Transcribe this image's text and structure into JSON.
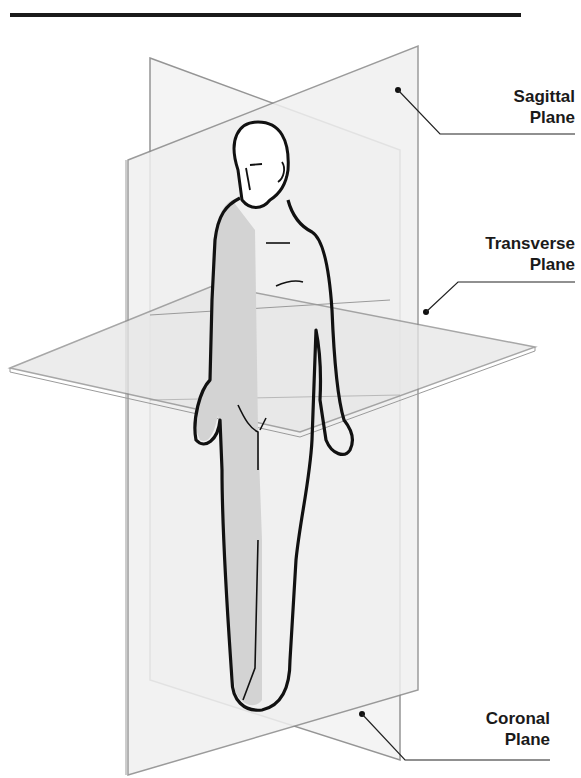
{
  "diagram": {
    "labels": [
      {
        "id": "sagittal",
        "line1": "Sagittal",
        "line2": "Plane"
      },
      {
        "id": "transverse",
        "line1": "Transverse",
        "line2": "Plane"
      },
      {
        "id": "coronal",
        "line1": "Coronal",
        "line2": "Plane"
      }
    ],
    "colors": {
      "plane_edge": "#8a8a8a",
      "plane_fill": "#f1f1f1",
      "body_outline": "#111111",
      "body_shade": "#d2d2d2",
      "text": "#1a1a1a",
      "rule": "#1a1a1a"
    }
  }
}
